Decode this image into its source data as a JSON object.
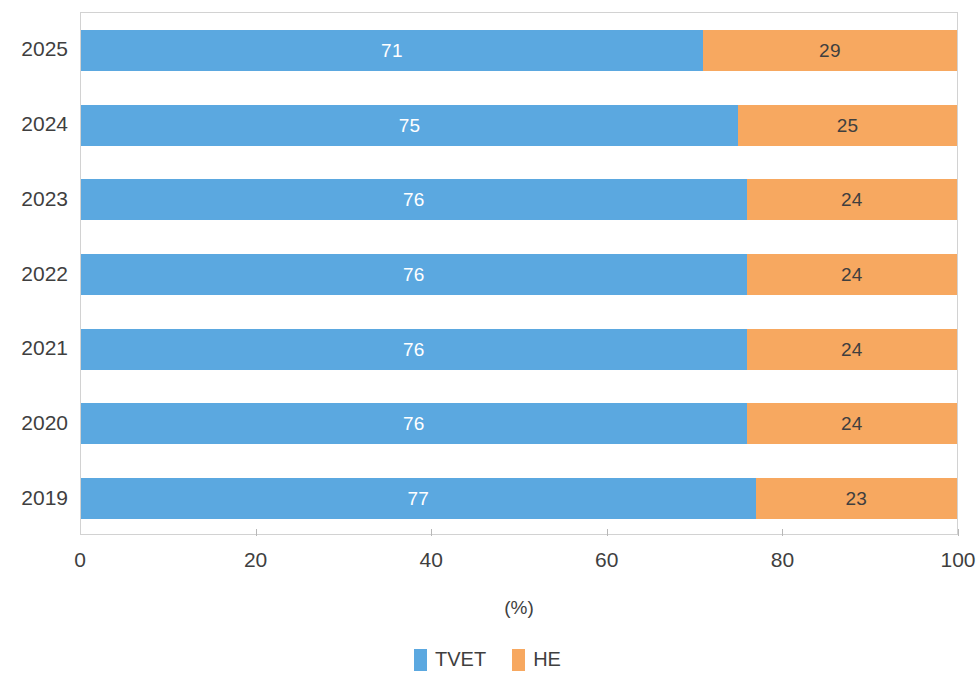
{
  "chart_data": {
    "type": "bar",
    "subtype": "horizontal-100-percent-stacked",
    "title": "",
    "subtitle": "",
    "xlabel": "(%)",
    "ylabel": "",
    "xlim": [
      0,
      100
    ],
    "xticks": [
      0,
      20,
      40,
      60,
      80,
      100
    ],
    "xtick_labels": [
      "0",
      "20",
      "40",
      "60",
      "80",
      "100"
    ],
    "grid": false,
    "legend_position": "bottom-center",
    "orientation": "horizontal",
    "categories": [
      "2025",
      "2024",
      "2023",
      "2022",
      "2021",
      "2020",
      "2019"
    ],
    "series": [
      {
        "name": "TVET",
        "color": "#5BA8E0",
        "label_color": "#ffffff",
        "values": [
          71,
          75,
          76,
          76,
          76,
          76,
          77
        ]
      },
      {
        "name": "HE",
        "color": "#F7A860",
        "label_color": "#3f3f3f",
        "values": [
          29,
          25,
          24,
          24,
          24,
          24,
          23
        ]
      }
    ]
  },
  "colors": {
    "tvet": "#5BA8E0",
    "he": "#F7A860",
    "axis_line": "#d2d2d2",
    "tick_mark": "#b8b8b8",
    "text": "#3f3f3f",
    "background": "#ffffff"
  },
  "legend": {
    "items": [
      {
        "label": "TVET",
        "color": "#5BA8E0"
      },
      {
        "label": "HE",
        "color": "#F7A860"
      }
    ]
  },
  "axis": {
    "x_title": "(%)"
  }
}
